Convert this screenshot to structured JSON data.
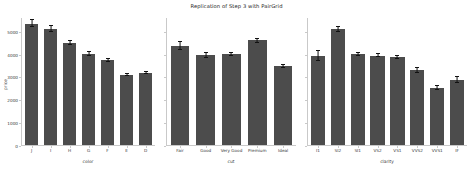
{
  "chart_data": {
    "type": "bar",
    "title": "Replication of Step 3 with PairGrid",
    "ylabel": "price",
    "ylim": [
      0,
      5600
    ],
    "yticks": [
      0,
      1000,
      2000,
      3000,
      4000,
      5000
    ],
    "ytick_labels": [
      "0",
      "1000",
      "2000",
      "3000",
      "4000",
      "5000"
    ],
    "grid": false,
    "legend": "none",
    "bar_color": "#4c4c4c",
    "errorbar_color": "#111111",
    "panels": [
      {
        "xlabel": "color",
        "categories": [
          "J",
          "I",
          "H",
          "G",
          "F",
          "E",
          "D"
        ],
        "values": [
          5324,
          5092,
          4487,
          3999,
          3725,
          3077,
          3170
        ],
        "err_low": [
          5180,
          4975,
          4395,
          3930,
          3660,
          3020,
          3110
        ],
        "err_high": [
          5470,
          5210,
          4580,
          4070,
          3790,
          3135,
          3230
        ]
      },
      {
        "xlabel": "cut",
        "categories": [
          "Fair",
          "Good",
          "Very Good",
          "Premium",
          "Ideal"
        ],
        "values": [
          4359,
          3929,
          3982,
          4584,
          3458
        ],
        "err_low": [
          4180,
          3830,
          3900,
          4500,
          3395
        ],
        "err_high": [
          4540,
          4030,
          4060,
          4670,
          3520
        ]
      },
      {
        "xlabel": "clarity",
        "categories": [
          "I1",
          "SI2",
          "SI1",
          "VS2",
          "VS1",
          "VVS2",
          "VVS1",
          "IF"
        ],
        "values": [
          3924,
          5063,
          3996,
          3925,
          3839,
          3284,
          2523,
          2865
        ],
        "err_low": [
          3700,
          4950,
          3930,
          3860,
          3760,
          3190,
          2440,
          2740
        ],
        "err_high": [
          4150,
          5180,
          4065,
          3990,
          3920,
          3380,
          2610,
          2990
        ]
      }
    ]
  }
}
